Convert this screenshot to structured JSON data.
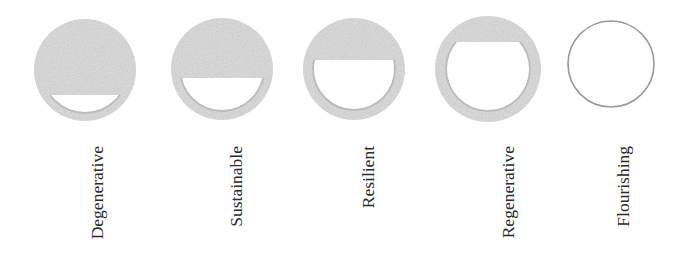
{
  "diagram": {
    "colors": {
      "fill": "#d9d9d9",
      "fill_noise": "#c9c9c9",
      "inner_shadow": "#b5b5b5",
      "outline": "#9a9a9a",
      "label": "#2a2a2a",
      "background": "#ffffff"
    },
    "stages": [
      {
        "label": "Degenerative",
        "cx": 85,
        "cy": 70,
        "r": 51,
        "cut_y": 95,
        "ring": 9,
        "filled": true
      },
      {
        "label": "Sustainable",
        "cx": 222,
        "cy": 69,
        "r": 51,
        "cut_y": 78,
        "ring": 10,
        "filled": true
      },
      {
        "label": "Resilient",
        "cx": 354,
        "cy": 69,
        "r": 51,
        "cut_y": 60,
        "ring": 11,
        "filled": true
      },
      {
        "label": "Regenerative",
        "cx": 488,
        "cy": 69,
        "r": 53,
        "cut_y": 42,
        "ring": 12,
        "filled": true
      },
      {
        "label": "Flourishing",
        "cx": 611,
        "cy": 64,
        "r": 43,
        "cut_y": 0,
        "ring": 0,
        "filled": false
      }
    ]
  }
}
